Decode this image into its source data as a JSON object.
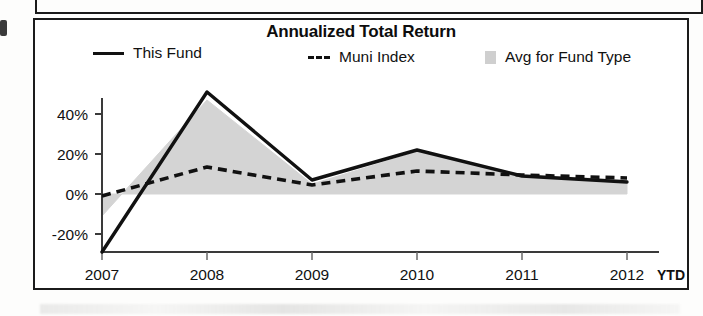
{
  "chart_data": {
    "type": "line",
    "title": "Annualized Total Return",
    "xlabel": "",
    "ylabel": "",
    "x": [
      "2007",
      "2008",
      "2009",
      "2010",
      "2011",
      "2012"
    ],
    "categories": [
      "2007",
      "2008",
      "2009",
      "2010",
      "2011",
      "2012"
    ],
    "x_tick_labels": [
      "2007",
      "2008",
      "2009",
      "2010",
      "2011",
      "2012"
    ],
    "x_axis_suffix": "YTD",
    "y_tick_labels": [
      "40%",
      "20%",
      "0%",
      "-20%"
    ],
    "y_ticks": [
      40,
      20,
      0,
      -20
    ],
    "ylim": [
      -32,
      54
    ],
    "xlim": [
      2007,
      2012
    ],
    "grid": false,
    "legend_position": "top",
    "series": [
      {
        "name": "This Fund",
        "style": "solid",
        "color": "#111111",
        "values": [
          -29,
          51,
          7,
          22,
          9,
          6
        ]
      },
      {
        "name": "Muni Index",
        "style": "dashed",
        "color": "#111111",
        "values": [
          -1,
          13.5,
          4.5,
          11.5,
          9.5,
          8
        ]
      },
      {
        "name": "Avg for Fund Type",
        "style": "area",
        "color": "#d2d2d2",
        "values": [
          -11,
          47,
          5,
          21,
          9.5,
          7
        ]
      }
    ]
  },
  "chart": {
    "title": "Annualized Total Return",
    "legend": [
      {
        "label": "This Fund",
        "marker": "solid-line-swatch"
      },
      {
        "label": "Muni Index",
        "marker": "dashed-line-swatch"
      },
      {
        "label": "Avg for Fund Type",
        "marker": "area-square-swatch"
      }
    ],
    "y_axis": {
      "labels": [
        "40%",
        "20%",
        "0%",
        "-20%"
      ]
    },
    "x_axis": {
      "labels": [
        "2007",
        "2008",
        "2009",
        "2010",
        "2011",
        "2012"
      ],
      "suffix": "YTD"
    },
    "colors": {
      "line": "#111111",
      "area_fill": "#d2d2d2",
      "frame": "#1b1b1b",
      "background": "#ffffff"
    }
  }
}
